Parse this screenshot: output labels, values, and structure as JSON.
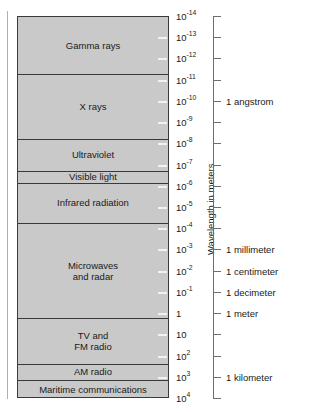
{
  "figure": {
    "axis_title": "Wavelength in meters",
    "caption": "",
    "colors": {
      "band_fill": "#c9c9c9",
      "band_stroke": "#3a3a3a",
      "axis_line": "#6e6e6e",
      "text": "#1a1a1a",
      "background": "#ffffff"
    }
  },
  "chart_data": {
    "type": "bar",
    "xlabel": "",
    "ylabel": "Wavelength in meters",
    "orientation": "vertical-log-scale",
    "grid": false,
    "legend": "none",
    "axis_scale": "log10",
    "axis_range_exponents": [
      -14,
      4
    ],
    "tick_exponents": [
      -14,
      -13,
      -12,
      -11,
      -10,
      -9,
      -8,
      -7,
      -6,
      -5,
      -4,
      -3,
      -2,
      -1,
      0,
      1,
      2,
      3,
      4
    ],
    "tick_labels": [
      "10⁻¹⁴",
      "10⁻¹³",
      "10⁻¹²",
      "10⁻¹¹",
      "10⁻¹⁰",
      "10⁻⁹",
      "10⁻⁸",
      "10⁻⁷",
      "10⁻⁶",
      "10⁻⁵",
      "10⁻⁴",
      "10⁻³",
      "10⁻²",
      "10⁻¹",
      "1",
      "10",
      "10²",
      "10³",
      "10⁴"
    ],
    "ticks": [
      {
        "mantissa": "10",
        "exponent": "-14"
      },
      {
        "mantissa": "10",
        "exponent": "-13"
      },
      {
        "mantissa": "10",
        "exponent": "-12"
      },
      {
        "mantissa": "10",
        "exponent": "-11"
      },
      {
        "mantissa": "10",
        "exponent": "-10"
      },
      {
        "mantissa": "10",
        "exponent": "-9"
      },
      {
        "mantissa": "10",
        "exponent": "-8"
      },
      {
        "mantissa": "10",
        "exponent": "-7"
      },
      {
        "mantissa": "10",
        "exponent": "-6"
      },
      {
        "mantissa": "10",
        "exponent": "-5"
      },
      {
        "mantissa": "10",
        "exponent": "-4"
      },
      {
        "mantissa": "10",
        "exponent": "-3"
      },
      {
        "mantissa": "10",
        "exponent": "-2"
      },
      {
        "mantissa": "10",
        "exponent": "-1"
      },
      {
        "mantissa": "1",
        "exponent": ""
      },
      {
        "mantissa": "10",
        "exponent": ""
      },
      {
        "mantissa": "10",
        "exponent": "2"
      },
      {
        "mantissa": "10",
        "exponent": "3"
      },
      {
        "mantissa": "10",
        "exponent": "4"
      }
    ],
    "bands": [
      {
        "label": "Gamma rays",
        "start_exponent": -14,
        "end_exponent": -11.3
      },
      {
        "label": "X rays",
        "start_exponent": -11.3,
        "end_exponent": -8.25
      },
      {
        "label": "Ultraviolet",
        "start_exponent": -8.25,
        "end_exponent": -6.75
      },
      {
        "label": "Visible light",
        "start_exponent": -6.75,
        "end_exponent": -6.2
      },
      {
        "label": "Infrared radiation",
        "start_exponent": -6.2,
        "end_exponent": -4.3
      },
      {
        "label": "Microwaves\nand radar",
        "start_exponent": -4.3,
        "end_exponent": 0.2
      },
      {
        "label": "TV and\nFM radio",
        "start_exponent": 0.2,
        "end_exponent": 2.35
      },
      {
        "label": "AM radio",
        "start_exponent": 2.35,
        "end_exponent": 3.1
      },
      {
        "label": "Maritime communications",
        "start_exponent": 3.1,
        "end_exponent": 4
      }
    ],
    "reference_marks": [
      {
        "label": "1 angstrom",
        "exponent": -10
      },
      {
        "label": "1 millimeter",
        "exponent": -3
      },
      {
        "label": "1 centimeter",
        "exponent": -2
      },
      {
        "label": "1 decimeter",
        "exponent": -1
      },
      {
        "label": "1 meter",
        "exponent": 0
      },
      {
        "label": "1 kilometer",
        "exponent": 3
      }
    ],
    "annotations": [
      "Gamma rays",
      "X rays",
      "Ultraviolet",
      "Visible light",
      "Infrared radiation",
      "Microwaves and radar",
      "TV and FM radio",
      "AM radio",
      "Maritime communications",
      "1 angstrom",
      "1 millimeter",
      "1 centimeter",
      "1 decimeter",
      "1 meter",
      "1 kilometer",
      "Wavelength in meters"
    ]
  }
}
